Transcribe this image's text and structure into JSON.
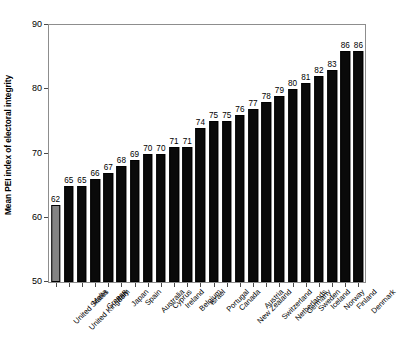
{
  "chart_data": {
    "type": "bar",
    "title": "",
    "subtitle": "",
    "xlabel": "",
    "ylabel": "Mean PEI index of electoral integrity",
    "ylim": [
      50,
      90
    ],
    "yticks": [
      50,
      60,
      70,
      80,
      90
    ],
    "grid": false,
    "legend": "none",
    "orientation": "vertical",
    "highlight_index": 0,
    "colors": {
      "bar": "#0a0a0a",
      "highlight_bar": "#848484",
      "frame": "#8d8d8d",
      "text": "#000000"
    },
    "categories": [
      "United States",
      "United Kingdom",
      "Malta",
      "Greece",
      "Italy",
      "Japan",
      "Spain",
      "Australia",
      "Cyprus",
      "Ireland",
      "Belgium",
      "Israel",
      "Portugal",
      "Canada",
      "New Zealand",
      "Austria",
      "Switzerland",
      "Netherlands",
      "Germany",
      "Sweden",
      "Iceland",
      "Norway",
      "Finland",
      "Denmark"
    ],
    "values": [
      62,
      65,
      65,
      66,
      67,
      68,
      69,
      70,
      70,
      71,
      71,
      74,
      75,
      75,
      76,
      77,
      78,
      79,
      80,
      81,
      82,
      83,
      86,
      86
    ],
    "value_labels": [
      "62",
      "65",
      "65",
      "66",
      "67",
      "68",
      "69",
      "70",
      "70",
      "71",
      "71",
      "74",
      "75",
      "75",
      "76",
      "77",
      "78",
      "79",
      "80",
      "81",
      "82",
      "83",
      "86",
      "86"
    ],
    "ytick_labels": [
      "50",
      "60",
      "70",
      "80",
      "90"
    ]
  }
}
